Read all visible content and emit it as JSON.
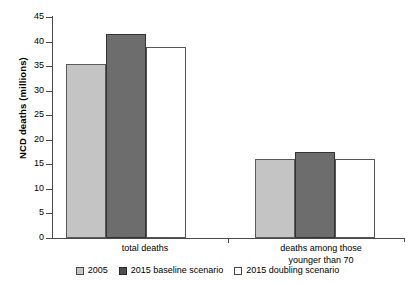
{
  "chart_data": {
    "type": "bar",
    "title": "",
    "xlabel": "",
    "ylabel": "NCD deaths (millions)",
    "ylim": [
      0,
      45
    ],
    "yticks": [
      0,
      5,
      10,
      15,
      20,
      25,
      30,
      35,
      40,
      45
    ],
    "ytick_labels": [
      "0",
      "5",
      "10",
      "15",
      "20",
      "25",
      "30",
      "35",
      "40",
      "45"
    ],
    "grid": false,
    "legend_position": "bottom",
    "categories": [
      "total deaths",
      "deaths among those younger than 70"
    ],
    "category_lines": [
      [
        "total deaths"
      ],
      [
        "deaths among those",
        "younger than 70"
      ]
    ],
    "series": [
      {
        "name": "2005",
        "values": [
          35.4,
          16.1
        ],
        "color": "#c4c4c4"
      },
      {
        "name": "2015 baseline scenario",
        "values": [
          41.5,
          17.5
        ],
        "color": "#6d6d6d"
      },
      {
        "name": "2015 doubling scenario",
        "values": [
          38.9,
          16.1
        ],
        "color": "#ffffff"
      }
    ]
  },
  "axis": {
    "y_title": "NCD deaths (millions)",
    "tick_labels": [
      "45",
      "40",
      "35",
      "30",
      "25",
      "20",
      "15",
      "10",
      "5",
      "0"
    ]
  },
  "categories": {
    "group1_line1": "total deaths",
    "group2_line1": "deaths among those",
    "group2_line2": "younger than 70"
  },
  "legend": {
    "items": [
      {
        "label": "2005",
        "swatch": "light-gray-swatch"
      },
      {
        "label": "2015 baseline scenario",
        "swatch": "dark-gray-swatch"
      },
      {
        "label": "2015 doubling scenario",
        "swatch": "white-swatch"
      }
    ]
  },
  "colors": {
    "series_2005": "#c4c4c4",
    "series_baseline": "#6d6d6d",
    "series_doubling": "#ffffff",
    "axis": "#4a4a4a",
    "background": "#ffffff"
  }
}
